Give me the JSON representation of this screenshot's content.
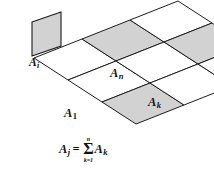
{
  "figure": {
    "type": "geometric-diagram",
    "background_color": "#ffffff",
    "shaded_fill_color": "#d2d2d2",
    "unshaded_fill_color": "#ffffff",
    "stroke_color": "#1c1c1c"
  },
  "panel": {
    "name": "small-quadrilateral",
    "label": "A",
    "subscript": "i",
    "shaded": true
  },
  "grid": {
    "rows": 3,
    "columns": 3,
    "cells": [
      {
        "id": "r0c0",
        "shaded": false,
        "label": "",
        "subscript": ""
      },
      {
        "id": "r0c1",
        "shaded": true,
        "label": "A",
        "subscript": "n"
      },
      {
        "id": "r0c2",
        "shaded": false,
        "label": "",
        "subscript": ""
      },
      {
        "id": "r1c0",
        "shaded": false,
        "label": "",
        "subscript": ""
      },
      {
        "id": "r1c1",
        "shaded": false,
        "label": "",
        "subscript": ""
      },
      {
        "id": "r1c2",
        "shaded": true,
        "label": "A",
        "subscript": "k"
      },
      {
        "id": "r2c0",
        "shaded": true,
        "label": "A",
        "subscript": "1"
      },
      {
        "id": "r2c1",
        "shaded": false,
        "label": "",
        "subscript": ""
      },
      {
        "id": "r2c2",
        "shaded": false,
        "label": "",
        "subscript": ""
      }
    ]
  },
  "labels": {
    "panel_base": "A",
    "panel_sub": "i",
    "an_base": "A",
    "an_sub": "n",
    "ak_base": "A",
    "ak_sub": "k",
    "a1_base": "A",
    "a1_sub": "1"
  },
  "equation": {
    "full_text": "A_j = sum_{k=1}^{n} A_k",
    "lhs_base": "A",
    "lhs_sub": "j",
    "equals": "=",
    "sigma": "Σ",
    "upper_limit": "n",
    "lower_limit": "k=1",
    "rhs_base": "A",
    "rhs_sub": "k"
  }
}
